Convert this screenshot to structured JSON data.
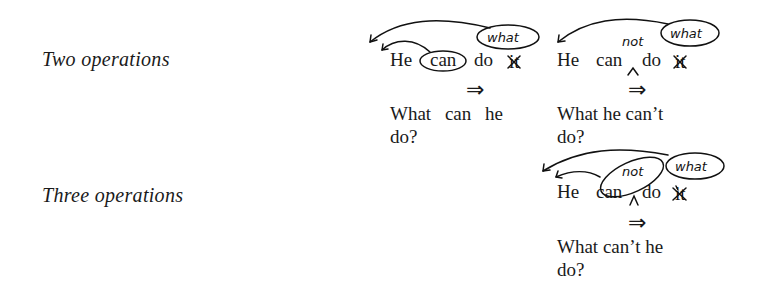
{
  "figure": {
    "rows": [
      {
        "label": "Two operations",
        "examples": [
          {
            "source": "He can do it",
            "source_parts": [
              "He",
              "can",
              "do",
              "it"
            ],
            "annotations": [
              "what"
            ],
            "circled": [
              "can",
              "what"
            ],
            "arrow": "⇒",
            "result_line1": "What can he",
            "result_line2": "do?"
          },
          {
            "source": "He can do it",
            "source_parts": [
              "He",
              "can",
              "do",
              "it"
            ],
            "annotations": [
              "not",
              "what"
            ],
            "circled": [
              "what"
            ],
            "arrow": "⇒",
            "result_line1": "What he can’t",
            "result_line2": "do?"
          }
        ]
      },
      {
        "label": "Three operations",
        "examples": [
          {
            "source": "He can do it",
            "source_parts": [
              "He",
              "can",
              "do",
              "it"
            ],
            "annotations": [
              "not",
              "what"
            ],
            "circled": [
              "can not",
              "what"
            ],
            "arrow": "⇒",
            "result_line1": "What can’t he",
            "result_line2": "do?"
          }
        ]
      }
    ]
  }
}
